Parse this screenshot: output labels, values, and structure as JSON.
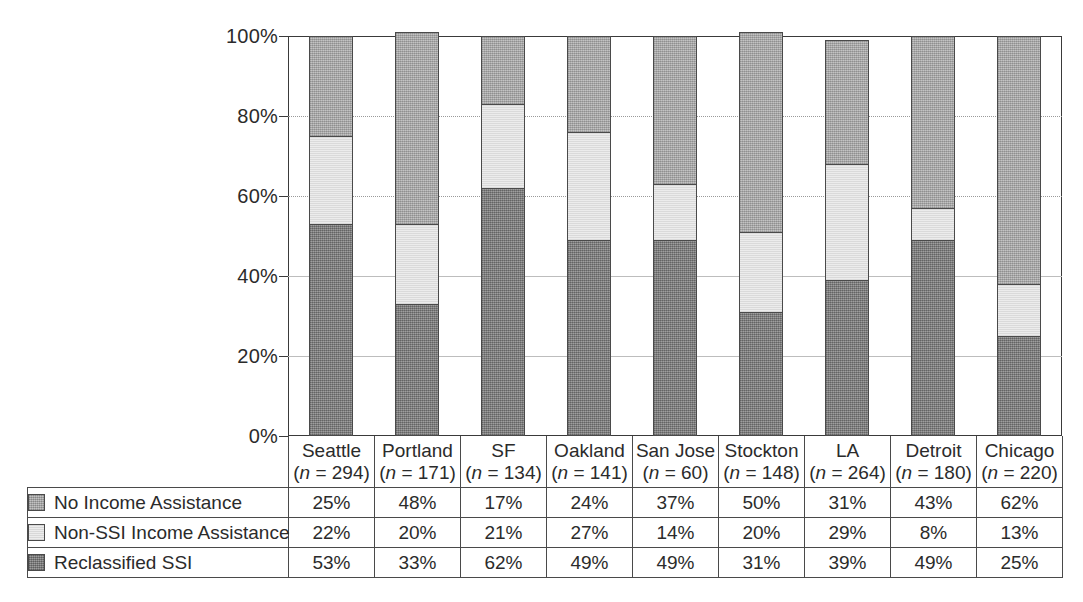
{
  "chart_data": {
    "type": "bar",
    "subtype": "stacked-percentage-column",
    "title": "",
    "subtitle": "",
    "xlabel": "",
    "ylabel": "",
    "ylim": [
      0,
      100
    ],
    "y_tick_labels": [
      "0%",
      "20%",
      "40%",
      "60%",
      "80%",
      "100%"
    ],
    "y_ticks": [
      0,
      20,
      40,
      60,
      80,
      100
    ],
    "grid": "horizontal-dotted",
    "legend_position": "table-left-column",
    "categories": [
      "Seattle",
      "Portland",
      "SF",
      "Oakland",
      "San Jose",
      "Stockton",
      "LA",
      "Detroit",
      "Chicago"
    ],
    "sample_sizes": [
      294,
      171,
      134,
      141,
      60,
      148,
      264,
      180,
      220
    ],
    "sample_size_labels": [
      "(n = 294)",
      "(n = 171)",
      "(n = 134)",
      "(n = 141)",
      "(n = 60)",
      "(n = 148)",
      "(n = 264)",
      "(n = 180)",
      "(n = 220)"
    ],
    "series": [
      {
        "name": "No Income Assistance",
        "color": "#adadad",
        "stack_order": 3,
        "values": [
          25,
          48,
          17,
          24,
          37,
          50,
          31,
          43,
          62
        ],
        "value_labels": [
          "25%",
          "48%",
          "17%",
          "24%",
          "37%",
          "50%",
          "31%",
          "43%",
          "62%"
        ]
      },
      {
        "name": "Non-SSI Income Assistance",
        "color": "#e6e6e6",
        "stack_order": 2,
        "values": [
          22,
          20,
          21,
          27,
          14,
          20,
          29,
          8,
          13
        ],
        "value_labels": [
          "22%",
          "20%",
          "21%",
          "27%",
          "14%",
          "20%",
          "29%",
          "8%",
          "13%"
        ]
      },
      {
        "name": "Reclassified SSI",
        "color": "#8a8a8a",
        "stack_order": 1,
        "values": [
          53,
          33,
          62,
          49,
          49,
          31,
          39,
          49,
          25
        ],
        "value_labels": [
          "53%",
          "33%",
          "62%",
          "49%",
          "49%",
          "31%",
          "39%",
          "49%",
          "25%"
        ]
      }
    ],
    "column_totals": [
      100,
      101,
      100,
      100,
      100,
      101,
      99,
      100,
      100
    ]
  },
  "axis": {
    "y_labels": [
      "100%",
      "80%",
      "60%",
      "40%",
      "20%",
      "0%"
    ]
  },
  "table": {
    "legend_rows": [
      {
        "label": "No Income Assistance",
        "swatch": "mid-gray-swatch"
      },
      {
        "label": "Non-SSI Income Assistance",
        "swatch": "light-gray-swatch"
      },
      {
        "label": "Reclassified SSI",
        "swatch": "dark-gray-swatch"
      }
    ],
    "columns": [
      {
        "city": "Seattle",
        "n": "(n = 294)"
      },
      {
        "city": "Portland",
        "n": "(n = 171)"
      },
      {
        "city": "SF",
        "n": "(n = 134)"
      },
      {
        "city": "Oakland",
        "n": "(n = 141)"
      },
      {
        "city": "San Jose",
        "n": "(n = 60)"
      },
      {
        "city": "Stockton",
        "n": "(n = 148)"
      },
      {
        "city": "LA",
        "n": "(n = 264)"
      },
      {
        "city": "Detroit",
        "n": "(n = 180)"
      },
      {
        "city": "Chicago",
        "n": "(n = 220)"
      }
    ],
    "rows": [
      [
        "25%",
        "48%",
        "17%",
        "24%",
        "37%",
        "50%",
        "31%",
        "43%",
        "62%"
      ],
      [
        "22%",
        "20%",
        "21%",
        "27%",
        "14%",
        "20%",
        "29%",
        "8%",
        "13%"
      ],
      [
        "53%",
        "33%",
        "62%",
        "49%",
        "49%",
        "31%",
        "39%",
        "49%",
        "25%"
      ]
    ]
  },
  "colors": {
    "no_income_assistance": "#adadad",
    "non_ssi_income_assistance": "#e6e6e6",
    "reclassified_ssi": "#8a8a8a",
    "axis_line": "#3a3a3a",
    "grid_line": "#9a9a9a",
    "text": "#2b2b2b"
  }
}
